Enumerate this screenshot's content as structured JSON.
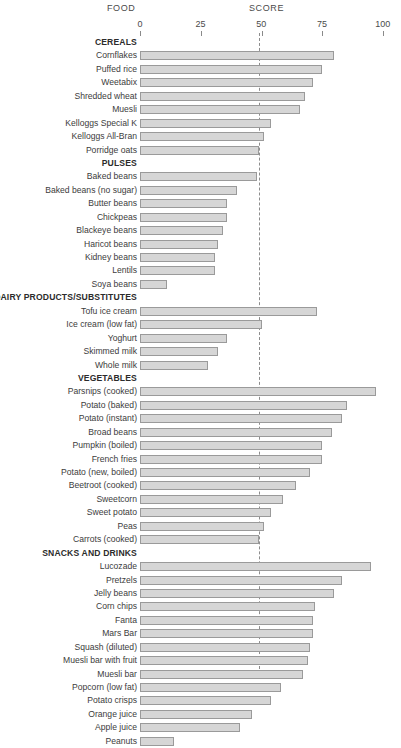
{
  "header": {
    "food_label": "FOOD",
    "score_label": "SCORE"
  },
  "axis": {
    "ticks": [
      "0",
      "25",
      "50",
      "75",
      "100"
    ],
    "reference_line_value": 50
  },
  "chart_data": {
    "type": "bar",
    "orientation": "horizontal",
    "title": "",
    "xlabel": "SCORE",
    "ylabel": "FOOD",
    "xlim": [
      0,
      100
    ],
    "grid": false,
    "legend": "none",
    "reference_line": 50,
    "annotations": [],
    "groups": [
      {
        "name": "CEREALS",
        "categories": [
          "Cornflakes",
          "Puffed rice",
          "Weetabix",
          "Shredded wheat",
          "Muesli",
          "Kelloggs Special K",
          "Kelloggs All-Bran",
          "Porridge oats"
        ],
        "values": [
          80,
          75,
          71,
          68,
          66,
          54,
          51,
          49
        ]
      },
      {
        "name": "PULSES",
        "categories": [
          "Baked beans",
          "Baked beans (no sugar)",
          "Butter beans",
          "Chickpeas",
          "Blackeye beans",
          "Haricot beans",
          "Kidney beans",
          "Lentils",
          "Soya beans"
        ],
        "values": [
          48,
          40,
          36,
          36,
          34,
          32,
          31,
          31,
          11
        ]
      },
      {
        "name": "DAIRY PRODUCTS/SUBSTITUTES",
        "categories": [
          "Tofu ice cream",
          "Ice cream (low fat)",
          "Yoghurt",
          "Skimmed milk",
          "Whole milk"
        ],
        "values": [
          73,
          50,
          36,
          32,
          28
        ]
      },
      {
        "name": "VEGETABLES",
        "categories": [
          "Parsnips (cooked)",
          "Potato (baked)",
          "Potato (instant)",
          "Broad beans",
          "Pumpkin (boiled)",
          "French fries",
          "Potato (new, boiled)",
          "Beetroot (cooked)",
          "Sweetcorn",
          "Sweet potato",
          "Peas",
          "Carrots (cooked)"
        ],
        "values": [
          97,
          85,
          83,
          79,
          75,
          75,
          70,
          64,
          59,
          54,
          51,
          49
        ]
      },
      {
        "name": "SNACKS AND DRINKS",
        "categories": [
          "Lucozade",
          "Pretzels",
          "Jelly beans",
          "Corn chips",
          "Fanta",
          "Mars Bar",
          "Squash (diluted)",
          "Muesli bar with fruit",
          "Muesli bar",
          "Popcorn (low fat)",
          "Potato crisps",
          "Orange juice",
          "Apple juice",
          "Peanuts"
        ],
        "values": [
          95,
          83,
          80,
          72,
          71,
          71,
          70,
          69,
          67,
          58,
          54,
          46,
          41,
          14
        ]
      }
    ]
  }
}
